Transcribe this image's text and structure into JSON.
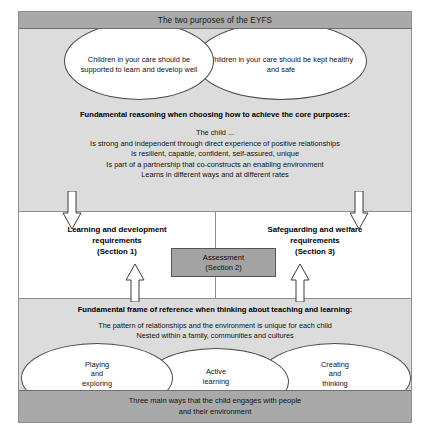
{
  "diagram": {
    "title": "The two purposes of the EYFS",
    "purposes": [
      "Children in your care should be supported to learn and develop well",
      "Children in your care should be kept healthy and safe"
    ],
    "reasoning": {
      "heading": "Fundamental reasoning when choosing how to achieve the core purposes:",
      "lead": "The child ...",
      "statements": [
        "Is strong and independent through direct experience of positive relationships",
        "Is resilient, capable, confident, self-assured, unique",
        "Is part of a partnership that co-constructs an enabling environment",
        "Learns in different ways and at different rates"
      ]
    },
    "requirements": {
      "left": [
        "Learning and development",
        "requirements",
        "(Section 1)"
      ],
      "right": [
        "Safeguarding and welfare",
        "requirements",
        "(Section 3)"
      ],
      "centre": [
        "Assessment",
        "(Section 2)"
      ]
    },
    "frame": {
      "heading": "Fundamental frame of reference when thinking about teaching and learning:",
      "statements": [
        "The pattern of relationships and the environment is unique for each child",
        "Nested within a family, communities and cultures"
      ],
      "ways": [
        [
          "Playing",
          "and",
          "exploring"
        ],
        [
          "Active",
          "learning"
        ],
        [
          "Creating",
          "and",
          "thinking"
        ]
      ],
      "footer": [
        "Three main ways that the child engages with people",
        "and their environment"
      ]
    },
    "arrows": {
      "down_left": "down-arrow",
      "down_right": "down-arrow",
      "up_left": "up-arrow",
      "up_right": "up-arrow"
    },
    "colors": {
      "header_bar": "#a9a9a9",
      "band_grey": "#dcdcdc",
      "band_white": "#ffffff",
      "assessment_box": "#a3a3a3",
      "outline": "#8e8e8e"
    }
  }
}
